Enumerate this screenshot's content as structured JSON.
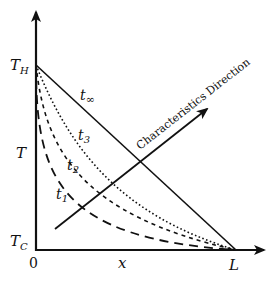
{
  "diagram": {
    "type": "temperature profile over space with characteristic direction",
    "axes": {
      "y_label": "T",
      "x_label": "x",
      "origin_label": "0",
      "y_ticks": {
        "top": "T",
        "top_sub": "H",
        "bottom": "T",
        "bottom_sub": "C"
      },
      "x_end_label": "L"
    },
    "curves": [
      {
        "id": "t1",
        "label": "t",
        "sub": "1",
        "style": "long-dash"
      },
      {
        "id": "t2",
        "label": "t",
        "sub": "2",
        "style": "short-dash"
      },
      {
        "id": "t3",
        "label": "t",
        "sub": "3",
        "style": "dotted"
      },
      {
        "id": "tinf",
        "label": "t",
        "sub": "∞",
        "style": "solid"
      }
    ],
    "arrow": {
      "label": "Characteristics Direction"
    },
    "colors": {
      "stroke": "#111111",
      "background": "#ffffff"
    }
  }
}
